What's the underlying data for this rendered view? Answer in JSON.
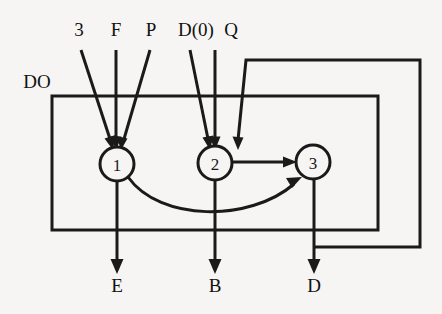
{
  "diagram": {
    "background_color": "#f6f5f3",
    "line_color": "#1a1a1a",
    "module_label": "DO",
    "nodes": [
      {
        "id": "n1",
        "label": "1",
        "cx": 117,
        "cy": 164,
        "r": 17
      },
      {
        "id": "n2",
        "label": "2",
        "cx": 215,
        "cy": 163,
        "r": 17
      },
      {
        "id": "n3",
        "label": "3",
        "cx": 313,
        "cy": 162,
        "r": 17
      }
    ],
    "inputs": [
      {
        "name": "input-3",
        "label": "3",
        "x": 79,
        "y": 36,
        "target": "n1"
      },
      {
        "name": "input-f",
        "label": "F",
        "x": 116,
        "y": 36,
        "target": "n1"
      },
      {
        "name": "input-p",
        "label": "P",
        "x": 151,
        "y": 36,
        "target": "n1"
      },
      {
        "name": "input-d0",
        "label": "D(0)",
        "x": 196,
        "y": 36,
        "target": "n2"
      },
      {
        "name": "input-q",
        "label": "Q",
        "x": 231,
        "y": 36,
        "target": "n2"
      }
    ],
    "outputs": [
      {
        "name": "output-e",
        "label": "E",
        "x": 117,
        "y": 292,
        "source": "n1"
      },
      {
        "name": "output-b",
        "label": "B",
        "x": 215,
        "y": 292,
        "source": "n2"
      },
      {
        "name": "output-d",
        "label": "D",
        "x": 314,
        "y": 292,
        "source": "n3"
      }
    ],
    "edges": [
      {
        "name": "edge-2-to-3",
        "from": "n2",
        "to": "n3",
        "style": "straight"
      },
      {
        "name": "edge-1-to-3",
        "from": "n1",
        "to": "n3",
        "style": "curved"
      }
    ],
    "feedback": {
      "name": "feedback-loop-d-to-2",
      "from": "output-d",
      "to": "n2",
      "description": "D output routed back around the right side into node 2"
    },
    "module_box": {
      "x": 52,
      "y": 96,
      "width": 326,
      "height": 134
    }
  }
}
